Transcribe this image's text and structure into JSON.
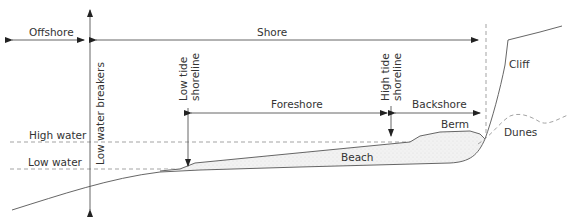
{
  "diagram": {
    "title": "",
    "labels": {
      "offshore": "Offshore",
      "shore": "Shore",
      "low_water_breakers": "Low water breakers",
      "low_tide_shoreline_1": "Low tide",
      "low_tide_shoreline_2": "shoreline",
      "high_tide_shoreline_1": "High tide",
      "high_tide_shoreline_2": "shoreline",
      "foreshore": "Foreshore",
      "backshore": "Backshore",
      "high_water": "High water",
      "low_water": "Low water",
      "berm": "Berm",
      "beach": "Beach",
      "cliff": "Cliff",
      "dunes": "Dunes"
    },
    "colors": {
      "line": "#555555",
      "dashed": "#999999",
      "text": "#333333",
      "beach_fill": "#efefef"
    }
  }
}
